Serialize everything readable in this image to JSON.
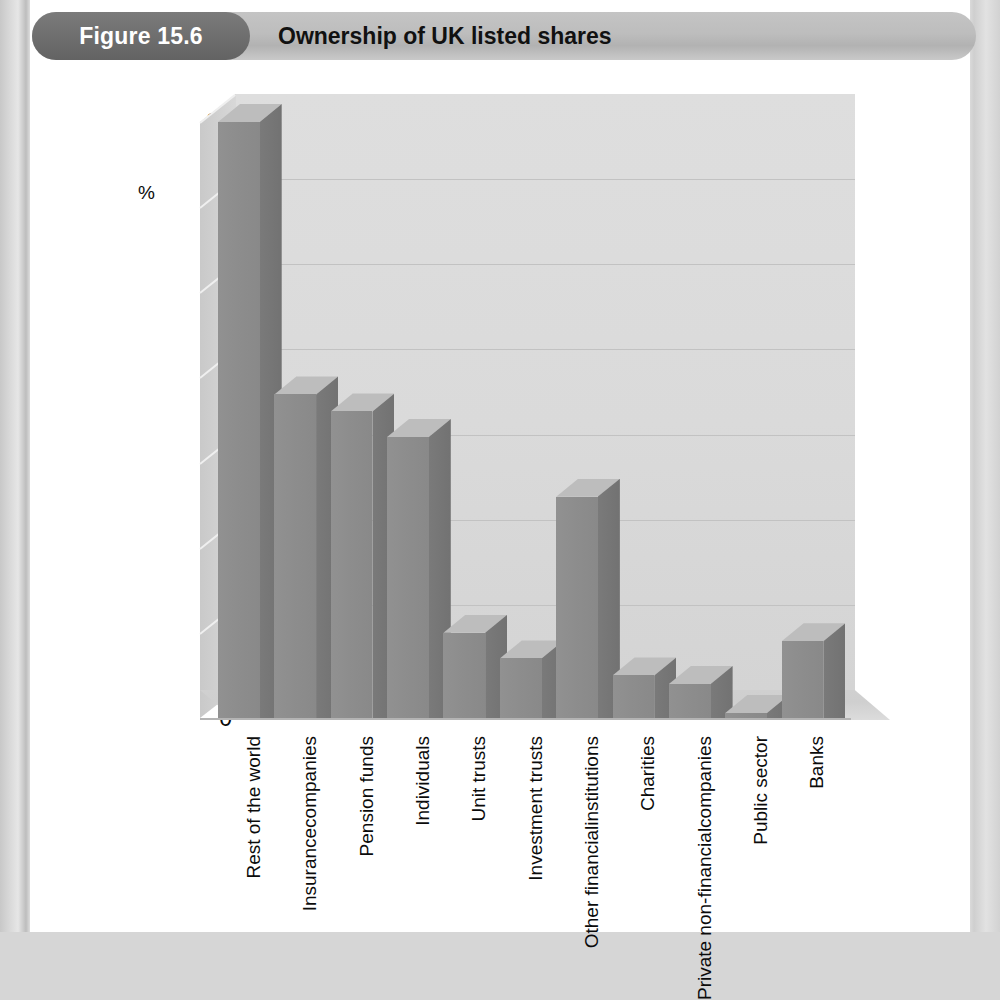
{
  "figure": {
    "badge_label": "Figure 15.6",
    "title": "Ownership of UK listed shares"
  },
  "colors": {
    "badge_bg": "#6f6f6f",
    "header_bg": "#bdbdbd",
    "bar_front": "#8d8d8d",
    "bar_side": "#727272",
    "bar_top": "#bdbdbd",
    "back_wall": "#dadada",
    "floor": "#cfcfcf",
    "gridline": "#c2c2c2",
    "text": "#0b0b0b",
    "page": "#ffffff"
  },
  "chart_data": {
    "type": "bar",
    "title": "Ownership of UK listed shares",
    "xlabel": "",
    "ylabel": "%",
    "ylim": [
      0,
      35
    ],
    "yticks": [
      0,
      5,
      10,
      15,
      20,
      25,
      30,
      35
    ],
    "grid": true,
    "legend": "none",
    "style": "3d-column",
    "categories": [
      "Rest of the world",
      "Insurance companies",
      "Pension funds",
      "Individuals",
      "Unit trusts",
      "Investment trusts",
      "Other financial institutions",
      "Charities",
      "Private non-financial companies",
      "Public sector",
      "Banks"
    ],
    "values": [
      35,
      19,
      18,
      16.5,
      5,
      3.5,
      13,
      2.5,
      2,
      0.3,
      4.5
    ]
  },
  "x_labels": [
    {
      "lines": [
        "Rest of the world"
      ]
    },
    {
      "lines": [
        "Insurance",
        "companies"
      ]
    },
    {
      "lines": [
        "Pension funds"
      ]
    },
    {
      "lines": [
        "Individuals"
      ]
    },
    {
      "lines": [
        "Unit trusts"
      ]
    },
    {
      "lines": [
        "Investment trusts"
      ]
    },
    {
      "lines": [
        "Other financial",
        "institutions"
      ]
    },
    {
      "lines": [
        "Charities"
      ]
    },
    {
      "lines": [
        "Private non-financial",
        "companies"
      ]
    },
    {
      "lines": [
        "Public sector"
      ]
    },
    {
      "lines": [
        "Banks"
      ]
    }
  ]
}
